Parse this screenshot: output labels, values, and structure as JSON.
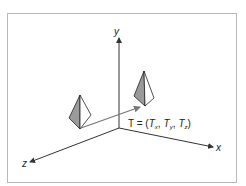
{
  "figure": {
    "frame_color": "#b8b8b8",
    "axis_color": "#333333",
    "arrow_color": "#777777",
    "face_shade": "#9a9a9a",
    "axes": {
      "x_label": "x",
      "y_label": "y",
      "z_label": "z"
    },
    "translation_label": {
      "prefix": "T = (",
      "tx_main": "T",
      "tx_sub": "x",
      "sep1": ",",
      "ty_main": "T",
      "ty_sub": "y",
      "sep2": ",",
      "tz_main": "T",
      "tz_sub": "z",
      "suffix": ")"
    },
    "objects": [
      {
        "name": "original-pyramid"
      },
      {
        "name": "translated-pyramid"
      }
    ]
  }
}
